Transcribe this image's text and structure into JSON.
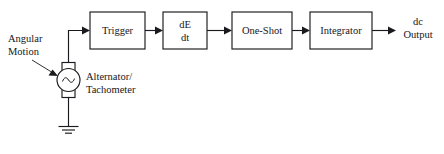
{
  "diagram": {
    "type": "block-diagram",
    "background_color": "#ffffff",
    "line_color": "#1a1a1e",
    "text_color": "#16161a"
  },
  "input": {
    "label_line1": "Angular",
    "label_line2": "Motion",
    "pointer": "dashed-arrow-to-source"
  },
  "source": {
    "symbol": "ac-source",
    "glyph": "sine",
    "label_line1": "Alternator/",
    "label_line2": "Tachometer",
    "ground": "earth-ground"
  },
  "blocks": [
    {
      "id": "trigger",
      "label": "Trigger",
      "lines": [
        "Trigger"
      ]
    },
    {
      "id": "derivative",
      "label": "dE dt",
      "lines": [
        "dE",
        "dt"
      ]
    },
    {
      "id": "one-shot",
      "label": "One-Shot",
      "lines": [
        "One-Shot"
      ]
    },
    {
      "id": "integrator",
      "label": "Integrator",
      "lines": [
        "Integrator"
      ]
    }
  ],
  "output": {
    "label_line1": "dc",
    "label_line2": "Output"
  }
}
